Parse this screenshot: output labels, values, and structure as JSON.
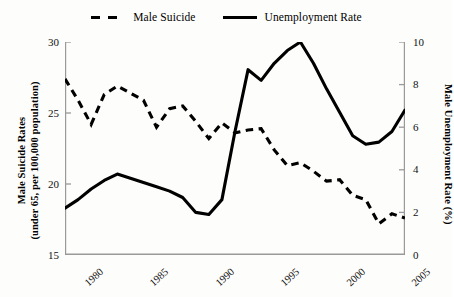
{
  "legend": {
    "position": "top-center",
    "entries": [
      {
        "label": "Male Suicide",
        "style": "dashed",
        "color": "#000000"
      },
      {
        "label": "Unemployment Rate",
        "style": "solid",
        "color": "#000000"
      }
    ]
  },
  "axes": {
    "left_title_line1": "Male Suicide Rates",
    "left_title_line2": "(under 65, per 100,000 population)",
    "right_title": "Male Unemployment Rate (%)",
    "left_ticks": [
      "15",
      "20",
      "25",
      "30"
    ],
    "right_ticks": [
      "0",
      "2",
      "4",
      "6",
      "8",
      "10"
    ],
    "x_ticks": [
      "1980",
      "1985",
      "1990",
      "1995",
      "2000",
      "2005"
    ]
  },
  "chart_data": {
    "type": "line",
    "title": "",
    "xlabel": "",
    "ylabel": "Male Suicide Rates (under 65, per 100,000 population)",
    "y2label": "Male Unemployment Rate (%)",
    "grid": false,
    "legend_position": "top-center",
    "xlim": [
      1979,
      2005
    ],
    "ylim": [
      15,
      30
    ],
    "y2lim": [
      0,
      10
    ],
    "x": [
      1979,
      1980,
      1981,
      1982,
      1983,
      1984,
      1985,
      1986,
      1987,
      1988,
      1989,
      1990,
      1991,
      1992,
      1993,
      1994,
      1995,
      1996,
      1997,
      1998,
      1999,
      2000,
      2001,
      2002,
      2003,
      2004,
      2005
    ],
    "series": [
      {
        "name": "Male Suicide",
        "axis": "left",
        "style": "dashed",
        "color": "#000000",
        "units": "per 100,000 population",
        "values": [
          27.4,
          25.9,
          24.2,
          26.3,
          26.9,
          26.4,
          25.9,
          24.0,
          25.3,
          25.5,
          24.4,
          23.2,
          24.3,
          23.6,
          23.8,
          23.9,
          22.4,
          21.3,
          21.5,
          20.9,
          20.2,
          20.3,
          19.2,
          18.9,
          17.2,
          17.9,
          17.6
        ]
      },
      {
        "name": "Unemployment Rate",
        "axis": "right",
        "style": "solid",
        "color": "#000000",
        "units": "%",
        "values": [
          2.2,
          2.6,
          3.1,
          3.5,
          3.8,
          3.6,
          3.4,
          3.2,
          3.0,
          2.7,
          2.0,
          1.9,
          2.6,
          5.8,
          8.7,
          8.2,
          9.0,
          9.6,
          10.0,
          9.0,
          7.8,
          6.7,
          5.6,
          5.2,
          5.3,
          5.8,
          6.8
        ]
      }
    ]
  }
}
